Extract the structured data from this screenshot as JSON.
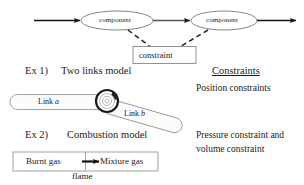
{
  "canvas": {
    "width": 304,
    "height": 185,
    "background": "#ffffff"
  },
  "colors": {
    "ink": "#1a1a1a",
    "outline": "#555555",
    "shape_fill": "#ffffff",
    "dashed": "#222222"
  },
  "flow_diagram": {
    "nodes": [
      {
        "id": "component-1",
        "label": "component",
        "shape": "ellipse"
      },
      {
        "id": "component-2",
        "label": "component",
        "shape": "ellipse"
      }
    ],
    "constraint_box": {
      "label": "constraint",
      "shape": "rectangle"
    },
    "arrows": [
      {
        "id": "arrow-in",
        "style": "solid"
      },
      {
        "id": "arrow-middle",
        "style": "solid"
      },
      {
        "id": "arrow-out",
        "style": "solid"
      }
    ],
    "connectors": [
      {
        "id": "connector-left",
        "style": "dashed"
      },
      {
        "id": "connector-right",
        "style": "dashed"
      }
    ]
  },
  "examples": [
    {
      "number": "Ex 1)",
      "title": "Two links model",
      "parts": [
        {
          "id": "link-a",
          "label": "Link",
          "italic_suffix": "a"
        },
        {
          "id": "link-b",
          "label": "Link",
          "italic_suffix": "b"
        }
      ],
      "joint": {
        "id": "revolute-joint",
        "shape": "concentric-circles"
      }
    },
    {
      "number": "Ex 2)",
      "title": "Combustion model",
      "cells": [
        {
          "id": "burnt-gas",
          "label": "Burnt gas"
        },
        {
          "id": "mixture-gas",
          "label": "Mixture gas"
        }
      ],
      "caption": "flame"
    }
  ],
  "constraints_column": {
    "heading": "Constraints",
    "items": [
      {
        "id": "position-constraints",
        "line1": "Position constraints",
        "line2": ""
      },
      {
        "id": "pressure-volume-constraints",
        "line1": "Pressure constraint and",
        "line2": "volume constraint"
      }
    ]
  }
}
